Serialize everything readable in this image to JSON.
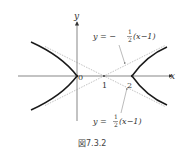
{
  "figure": {
    "caption": "図7.3.2",
    "axes": {
      "x_label": "x",
      "y_label": "y"
    },
    "ticks": {
      "origin": "0",
      "one": "1",
      "two": "2"
    },
    "asymptote_upper_label": {
      "lhs": "y = −",
      "num": "1",
      "den": "2",
      "rhs": "(x−1)"
    },
    "asymptote_lower_label": {
      "lhs": "y =",
      "num": "1",
      "den": "2",
      "rhs": "(x−1)"
    },
    "colors": {
      "curve": "#1a1a1a",
      "axis": "#555555",
      "asymptote": "#999999"
    }
  }
}
